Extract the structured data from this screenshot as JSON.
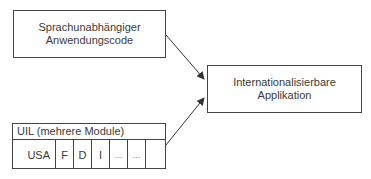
{
  "diagram": {
    "nodes": {
      "source": {
        "line1": "Sprachunabhängiger",
        "line2": "Anwendungscode"
      },
      "target": {
        "line1": "Internationalisierbare",
        "line2": "Applikation"
      },
      "uil": {
        "header": "UIL (mehrere Module)",
        "cells": [
          "USA",
          "F",
          "D",
          "I",
          "...",
          "...",
          ""
        ]
      }
    },
    "edges": [
      {
        "from": "source",
        "to": "target"
      },
      {
        "from": "uil",
        "to": "target"
      }
    ]
  }
}
